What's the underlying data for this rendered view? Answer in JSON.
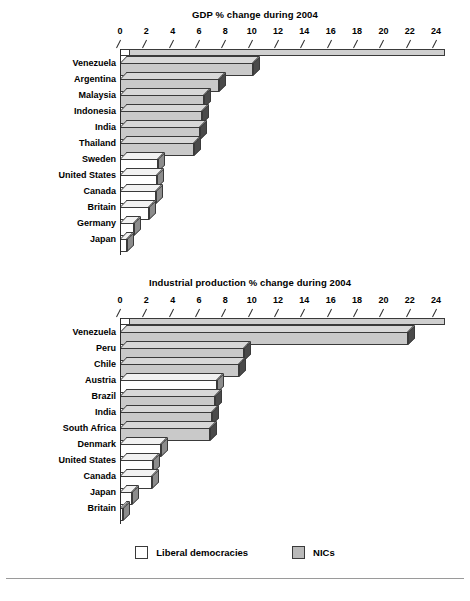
{
  "chart_data": [
    {
      "type": "bar",
      "orientation": "horizontal",
      "title": "GDP % change during 2004",
      "xlabel": "",
      "ylabel": "",
      "xlim": [
        0,
        24
      ],
      "xticks": [
        0,
        2,
        4,
        6,
        8,
        10,
        12,
        14,
        16,
        18,
        20,
        22,
        24
      ],
      "grid": false,
      "categories": [
        "Venezuela",
        "Argentina",
        "Malaysia",
        "Indonesia",
        "India",
        "Thailand",
        "Sweden",
        "United States",
        "Canada",
        "Britain",
        "Germany",
        "Japan"
      ],
      "values": [
        10.1,
        7.5,
        6.4,
        6.2,
        6.1,
        5.6,
        2.9,
        2.8,
        2.7,
        2.2,
        1.1,
        0.5
      ],
      "groups": [
        "NICs",
        "NICs",
        "NICs",
        "NICs",
        "NICs",
        "NICs",
        "Liberal democracies",
        "Liberal democracies",
        "Liberal democracies",
        "Liberal democracies",
        "Liberal democracies",
        "Liberal democracies"
      ]
    },
    {
      "type": "bar",
      "orientation": "horizontal",
      "title": "Industrial production % change during 2004",
      "xlabel": "",
      "ylabel": "",
      "xlim": [
        0,
        24
      ],
      "xticks": [
        0,
        2,
        4,
        6,
        8,
        10,
        12,
        14,
        16,
        18,
        20,
        22,
        24
      ],
      "grid": false,
      "categories": [
        "Venezuela",
        "Peru",
        "Chile",
        "Austria",
        "Brazil",
        "India",
        "South Africa",
        "Denmark",
        "United States",
        "Canada",
        "Japan",
        "Britain"
      ],
      "values": [
        21.9,
        9.4,
        9.0,
        7.4,
        7.2,
        7.0,
        6.8,
        3.1,
        2.5,
        2.4,
        0.9,
        0.2
      ],
      "groups": [
        "NICs",
        "NICs",
        "NICs",
        "Liberal democracies",
        "NICs",
        "NICs",
        "NICs",
        "Liberal democracies",
        "Liberal democracies",
        "Liberal democracies",
        "Liberal democracies",
        "Liberal democracies"
      ]
    }
  ],
  "charts": [
    {
      "id": "gdp",
      "title": "GDP % change during 2004",
      "ticks": [
        "0",
        "2",
        "4",
        "6",
        "8",
        "10",
        "12",
        "14",
        "16",
        "18",
        "20",
        "22",
        "24"
      ],
      "rows": [
        {
          "label": "Venezuela",
          "value": 10.1,
          "group": "nic"
        },
        {
          "label": "Argentina",
          "value": 7.5,
          "group": "nic"
        },
        {
          "label": "Malaysia",
          "value": 6.4,
          "group": "nic"
        },
        {
          "label": "Indonesia",
          "value": 6.2,
          "group": "nic"
        },
        {
          "label": "India",
          "value": 6.1,
          "group": "nic"
        },
        {
          "label": "Thailand",
          "value": 5.6,
          "group": "nic"
        },
        {
          "label": "Sweden",
          "value": 2.9,
          "group": "liberal"
        },
        {
          "label": "United States",
          "value": 2.8,
          "group": "liberal"
        },
        {
          "label": "Canada",
          "value": 2.7,
          "group": "liberal"
        },
        {
          "label": "Britain",
          "value": 2.2,
          "group": "liberal"
        },
        {
          "label": "Germany",
          "value": 1.1,
          "group": "liberal"
        },
        {
          "label": "Japan",
          "value": 0.5,
          "group": "liberal"
        }
      ]
    },
    {
      "id": "indus",
      "title": "Industrial production % change during 2004",
      "ticks": [
        "0",
        "2",
        "4",
        "6",
        "8",
        "10",
        "12",
        "14",
        "16",
        "18",
        "20",
        "22",
        "24"
      ],
      "rows": [
        {
          "label": "Venezuela",
          "value": 21.9,
          "group": "nic"
        },
        {
          "label": "Peru",
          "value": 9.4,
          "group": "nic"
        },
        {
          "label": "Chile",
          "value": 9.0,
          "group": "nic"
        },
        {
          "label": "Austria",
          "value": 7.4,
          "group": "liberal"
        },
        {
          "label": "Brazil",
          "value": 7.2,
          "group": "nic"
        },
        {
          "label": "India",
          "value": 7.0,
          "group": "nic"
        },
        {
          "label": "South Africa",
          "value": 6.8,
          "group": "nic"
        },
        {
          "label": "Denmark",
          "value": 3.1,
          "group": "liberal"
        },
        {
          "label": "United States",
          "value": 2.5,
          "group": "liberal"
        },
        {
          "label": "Canada",
          "value": 2.4,
          "group": "liberal"
        },
        {
          "label": "Japan",
          "value": 0.9,
          "group": "liberal"
        },
        {
          "label": "Britain",
          "value": 0.2,
          "group": "liberal"
        }
      ]
    }
  ],
  "legend": {
    "items": [
      {
        "label": "Liberal democracies",
        "group": "liberal",
        "color": "#ffffff"
      },
      {
        "label": "NICs",
        "group": "nic",
        "color": "#b9b9b9"
      }
    ]
  },
  "colors": {
    "nic_face": "#c9c9c9",
    "liberal_face": "#ffffff",
    "outline": "#3a3a3a",
    "nic_side": "#4a4a4a",
    "liberal_side": "#8c8c8c"
  }
}
